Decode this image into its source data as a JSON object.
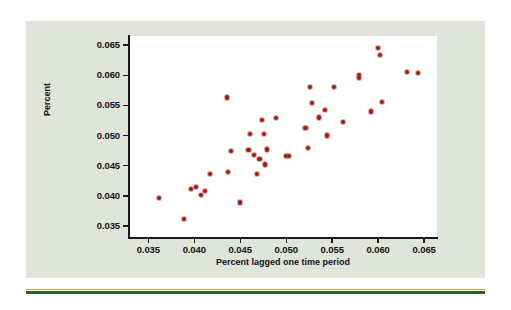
{
  "figure": {
    "panel_color": "#dfe5d8",
    "plot_background": "#ffffff",
    "rule_color": "#2f5d35"
  },
  "chart_data": {
    "type": "scatter",
    "title": "",
    "xlabel": "Percent lagged one time period",
    "ylabel": "Percent",
    "xlim": [
      0.0329,
      0.0664
    ],
    "ylim": [
      0.0332,
      0.0665
    ],
    "xticks": [
      "0.035",
      "0.040",
      "0.045",
      "0.050",
      "0.055",
      "0.060",
      "0.065"
    ],
    "yticks": [
      "0.035",
      "0.040",
      "0.045",
      "0.050",
      "0.055",
      "0.060",
      "0.065"
    ],
    "xtick_values": [
      0.035,
      0.04,
      0.045,
      0.05,
      0.055,
      0.06,
      0.065
    ],
    "ytick_values": [
      0.035,
      0.04,
      0.045,
      0.05,
      0.055,
      0.06,
      0.065
    ],
    "grid": false,
    "legend": false,
    "marker_color": "#9e1b15",
    "series": [
      {
        "name": "Percent vs lagged percent",
        "points": [
          [
            0.0362,
            0.0396
          ],
          [
            0.0389,
            0.0362
          ],
          [
            0.0396,
            0.0412
          ],
          [
            0.0402,
            0.0415
          ],
          [
            0.0407,
            0.0401
          ],
          [
            0.0412,
            0.0408
          ],
          [
            0.0417,
            0.0437
          ],
          [
            0.0436,
            0.0563
          ],
          [
            0.0437,
            0.044
          ],
          [
            0.044,
            0.0475
          ],
          [
            0.045,
            0.0389
          ],
          [
            0.0459,
            0.0476
          ],
          [
            0.0461,
            0.0503
          ],
          [
            0.0465,
            0.0468
          ],
          [
            0.0468,
            0.0436
          ],
          [
            0.0471,
            0.0461
          ],
          [
            0.0474,
            0.0526
          ],
          [
            0.0476,
            0.0502
          ],
          [
            0.0477,
            0.0452
          ],
          [
            0.0479,
            0.0477
          ],
          [
            0.0489,
            0.0529
          ],
          [
            0.05,
            0.0466
          ],
          [
            0.0503,
            0.0466
          ],
          [
            0.0521,
            0.0513
          ],
          [
            0.0524,
            0.048
          ],
          [
            0.0526,
            0.0581
          ],
          [
            0.0528,
            0.0554
          ],
          [
            0.0536,
            0.053
          ],
          [
            0.0542,
            0.0543
          ],
          [
            0.0544,
            0.05
          ],
          [
            0.0552,
            0.0581
          ],
          [
            0.0562,
            0.0522
          ],
          [
            0.0579,
            0.0601
          ],
          [
            0.0579,
            0.0596
          ],
          [
            0.0592,
            0.054
          ],
          [
            0.06,
            0.0645
          ],
          [
            0.0602,
            0.0634
          ],
          [
            0.0604,
            0.0556
          ],
          [
            0.0631,
            0.0606
          ],
          [
            0.0643,
            0.0604
          ]
        ]
      }
    ]
  }
}
